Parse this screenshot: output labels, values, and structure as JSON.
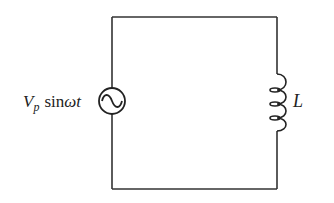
{
  "diagram": {
    "type": "circuit",
    "colors": {
      "wire": "#333333",
      "background": "#ffffff",
      "text": "#222222"
    },
    "source": {
      "kind": "ac-voltage-source",
      "label_symbol": "V",
      "label_subscript": "p",
      "label_function": "sin",
      "label_omega": "ω",
      "label_t": "t"
    },
    "inductor": {
      "kind": "inductor",
      "label": "L"
    }
  }
}
